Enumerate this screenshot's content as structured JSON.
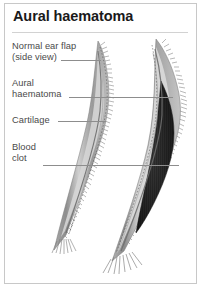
{
  "card": {
    "title": "Aural haematoma",
    "border_color": "#c8c8c8",
    "background_color": "#ffffff",
    "rule_color": "#d2d2d2"
  },
  "labels": [
    {
      "id": "normal",
      "text": "Normal ear flap\n(side view)",
      "line1": "Normal ear flap",
      "line2": "(side view)"
    },
    {
      "id": "haematoma",
      "text": "Aural\nhaematoma",
      "line1": "Aural",
      "line2": "haematoma"
    },
    {
      "id": "cartilage",
      "text": "Cartilage",
      "line1": "Cartilage",
      "line2": ""
    },
    {
      "id": "blood",
      "text": "Blood\nclot",
      "line1": "Blood",
      "line2": "clot"
    }
  ],
  "illustration": {
    "type": "medical-diagram",
    "description": "Two side-view ear flap cross sections of a dog ear",
    "figures": [
      {
        "name": "normal-ear-flap",
        "state": "normal"
      },
      {
        "name": "haematoma-ear-flap",
        "state": "swollen with blood clot"
      }
    ],
    "colors": {
      "skin_outer": "#8f8f8f",
      "skin_mid": "#bdbdbd",
      "cartilage": "#d8d8d8",
      "cartilage_line": "#707070",
      "blood_clot": "#2a2a2a",
      "hair": "#7a7a7a",
      "leader_line": "#8d8d8d",
      "label_text": "#4a4a4a",
      "title_text": "#1a1a1a"
    }
  }
}
